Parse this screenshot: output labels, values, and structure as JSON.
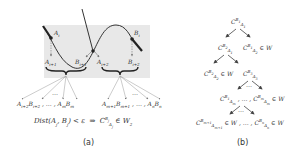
{
  "panel_a": {
    "label_Ai": "A_i",
    "label_Bi": "B_i",
    "label_Ai1": "A_{i+1}",
    "label_Bi1": "B_{i+1}",
    "label_Ai2": "A_{i+2}",
    "label_Bi2": "B_{i+2}",
    "left_leaves": "A_{i+2}B_{i+2} , … , A_m B_m",
    "right_leaves": "A_{m+1}B_{m+1} , … , A_n B_n",
    "formula": "Dist(A_j, B_j) < ε  ⇒  C^{B_j}_{A_j} ∈ W_2",
    "caption": "(a)"
  },
  "panel_b": {
    "root": "C^{B_1}_{A_1}",
    "l1_left": "C^{B_2}_{A_1}",
    "l1_right": "C^{B_1}_{A_2} ∈ W",
    "l2_left": "C^{B_2}_{A_2} ∈ W",
    "l2_right": "C^{B_3}_{A_3}",
    "l3": "C^{B_1}_{A_m} , … , C^{B_m}_{A_m} ∈ W",
    "l4": "C^{B_{m+1}}_{A_{m+1}} ∈ W , … , C^{B_n}_{A_n} ∈ W",
    "dots": "…",
    "caption": "(b)"
  },
  "colors": {
    "shade": "#e6e6e6",
    "line": "#333333",
    "arrow": "#666666"
  }
}
